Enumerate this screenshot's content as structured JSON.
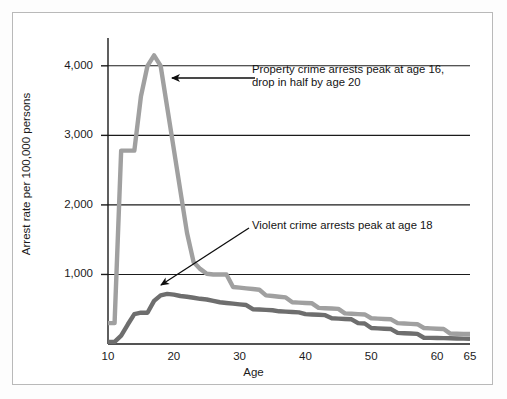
{
  "figure": {
    "background": "#ffffff",
    "frame_color": "#b9b9b9"
  },
  "chart_data": {
    "type": "line",
    "title": "",
    "xlabel": "Age",
    "ylabel": "Arrest rate per 100,000 persons",
    "xlim": [
      10,
      65
    ],
    "ylim": [
      0,
      4400
    ],
    "grid": "horizontal",
    "legend": "none",
    "x_ticks": [
      "10",
      "20",
      "30",
      "40",
      "50",
      "60",
      "65"
    ],
    "x_tick_values": [
      10,
      20,
      30,
      40,
      50,
      60,
      65
    ],
    "y_ticks": [
      "1,000",
      "2,000",
      "3,000",
      "4,000"
    ],
    "y_tick_values": [
      1000,
      2000,
      3000,
      4000
    ],
    "x": [
      10,
      11,
      12,
      13,
      14,
      15,
      16,
      17,
      18,
      19,
      20,
      21,
      22,
      23,
      24,
      25,
      26,
      27,
      28,
      29,
      30,
      31,
      32,
      33,
      34,
      35,
      36,
      37,
      38,
      39,
      40,
      41,
      42,
      43,
      44,
      45,
      46,
      47,
      48,
      49,
      50,
      51,
      52,
      53,
      54,
      55,
      56,
      57,
      58,
      59,
      60,
      61,
      62,
      63,
      64,
      65
    ],
    "series": [
      {
        "name": "Property crime arrests",
        "color": "#a0a0a0",
        "values": [
          300,
          300,
          2780,
          2780,
          2780,
          3560,
          4000,
          4150,
          4000,
          3400,
          2800,
          2200,
          1600,
          1180,
          1080,
          1010,
          1000,
          1000,
          1000,
          820,
          810,
          800,
          790,
          780,
          700,
          690,
          680,
          670,
          600,
          595,
          590,
          585,
          520,
          515,
          510,
          505,
          440,
          435,
          430,
          425,
          370,
          365,
          360,
          355,
          300,
          295,
          290,
          285,
          230,
          225,
          220,
          215,
          150,
          148,
          146,
          145
        ]
      },
      {
        "name": "Violent crime arrests",
        "color": "#6e6e6e",
        "values": [
          30,
          30,
          120,
          280,
          430,
          450,
          450,
          620,
          700,
          720,
          710,
          690,
          680,
          665,
          650,
          640,
          620,
          600,
          590,
          580,
          570,
          560,
          500,
          495,
          490,
          485,
          470,
          465,
          460,
          455,
          430,
          425,
          420,
          415,
          370,
          365,
          360,
          355,
          300,
          295,
          230,
          225,
          220,
          215,
          160,
          155,
          150,
          145,
          90,
          88,
          86,
          84,
          82,
          80,
          78,
          76
        ]
      }
    ],
    "annotations": [
      {
        "id": "property",
        "text": "Property crime arrests peak at age 16,\ndrop in half by age 20",
        "arrow": "left",
        "arrow_from_x": 255,
        "arrow_from_y": 78,
        "arrow_to_x": 172,
        "arrow_to_y": 78
      },
      {
        "id": "violent",
        "text": "Violent crime arrests peak at age 18",
        "arrow": "down-left",
        "arrow_from_x": 249,
        "arrow_from_y": 228,
        "arrow_to_x": 160,
        "arrow_to_y": 285
      }
    ]
  }
}
